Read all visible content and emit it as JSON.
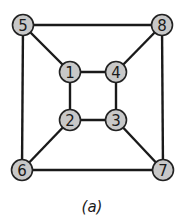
{
  "diagram": {
    "type": "graph",
    "caption": "(a)",
    "colors": {
      "node_fill": "#c8c8c8",
      "node_stroke": "#222222",
      "edge": "#1a1a1a"
    },
    "nodes": [
      {
        "id": "1",
        "label": "1",
        "x": 70,
        "y": 72
      },
      {
        "id": "2",
        "label": "2",
        "x": 70,
        "y": 120
      },
      {
        "id": "3",
        "label": "3",
        "x": 116,
        "y": 120
      },
      {
        "id": "4",
        "label": "4",
        "x": 116,
        "y": 72
      },
      {
        "id": "5",
        "label": "5",
        "x": 23,
        "y": 25
      },
      {
        "id": "6",
        "label": "6",
        "x": 22,
        "y": 170
      },
      {
        "id": "7",
        "label": "7",
        "x": 163,
        "y": 170
      },
      {
        "id": "8",
        "label": "8",
        "x": 162,
        "y": 25
      }
    ],
    "edges": [
      [
        "5",
        "8"
      ],
      [
        "5",
        "6"
      ],
      [
        "6",
        "7"
      ],
      [
        "8",
        "7"
      ],
      [
        "1",
        "4"
      ],
      [
        "1",
        "2"
      ],
      [
        "2",
        "3"
      ],
      [
        "4",
        "3"
      ],
      [
        "5",
        "1"
      ],
      [
        "8",
        "4"
      ],
      [
        "6",
        "2"
      ],
      [
        "7",
        "3"
      ]
    ]
  }
}
